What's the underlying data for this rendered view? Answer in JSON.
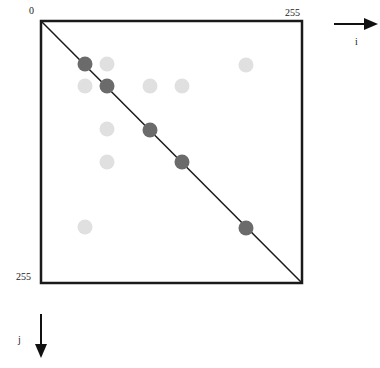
{
  "labels": {
    "origin": "0",
    "i_max": "255",
    "j_max": "255",
    "i_axis": "i",
    "j_axis": "j"
  },
  "colors": {
    "frame": "#1a1a1a",
    "on_diagonal": "#6b6b6b",
    "off_diagonal": "#e0e0e0"
  },
  "points_on_diagonal": [
    [
      85,
      64
    ],
    [
      107,
      86
    ],
    [
      150,
      130
    ],
    [
      182,
      162
    ],
    [
      246,
      228
    ]
  ],
  "points_off_diagonal": [
    [
      107,
      64
    ],
    [
      85,
      86
    ],
    [
      150,
      86
    ],
    [
      182,
      86
    ],
    [
      246,
      65
    ],
    [
      107,
      129
    ],
    [
      107,
      162
    ],
    [
      85,
      227
    ]
  ]
}
